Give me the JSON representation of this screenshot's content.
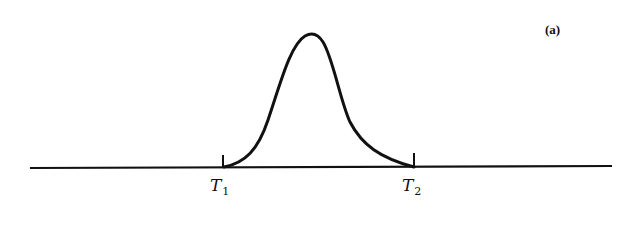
{
  "figure": {
    "panel_label": "(a)",
    "markers": [
      {
        "name": "T",
        "subscript": "1"
      },
      {
        "name": "T",
        "subscript": "2"
      }
    ]
  },
  "colors": {
    "ink": "#111111",
    "background": "#ffffff"
  }
}
